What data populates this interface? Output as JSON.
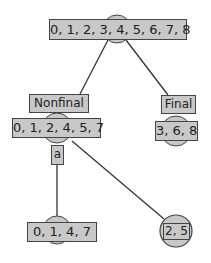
{
  "diagram": {
    "colors": {
      "fill": "#c8c8c8",
      "stroke": "#444444",
      "edge": "#333333"
    },
    "nodes": {
      "root": {
        "set": "0, 1, 2, 3, 4, 5, 6, 7, 8"
      },
      "nonfinal": {
        "label": "Nonfinal",
        "set": "0, 1, 2, 4, 5, 7"
      },
      "final": {
        "label": "Final",
        "set": "3, 6, 8"
      },
      "left_leaf": {
        "set": "0, 1, 4, 7"
      },
      "right_leaf": {
        "set": "2, 5"
      }
    },
    "edges": [
      {
        "from": "root",
        "to": "nonfinal"
      },
      {
        "from": "root",
        "to": "final"
      },
      {
        "from": "nonfinal",
        "to": "left_leaf",
        "label": "a"
      },
      {
        "from": "nonfinal",
        "to": "right_leaf"
      }
    ]
  }
}
